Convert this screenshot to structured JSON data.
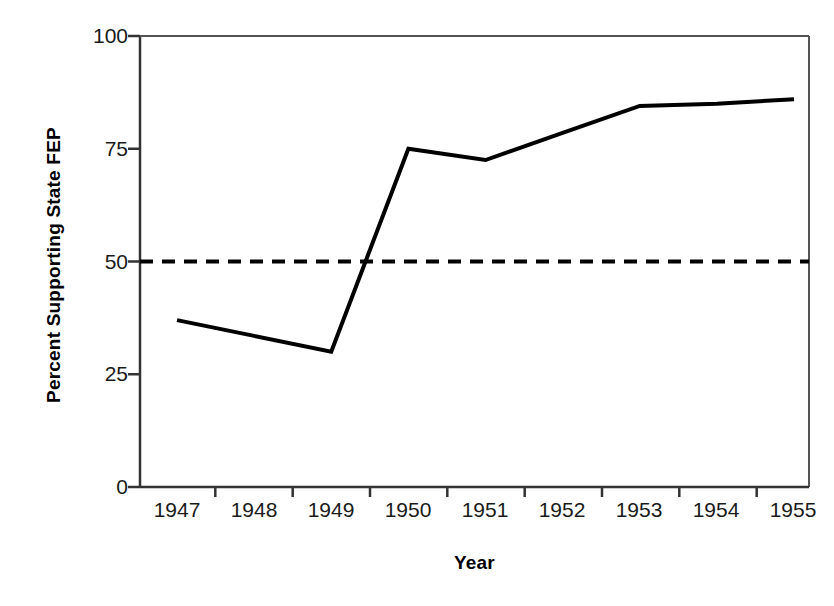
{
  "chart_data": {
    "type": "line",
    "title": "",
    "subtitle": "",
    "xlabel": "Year",
    "ylabel": "Percent Supporting State FEP",
    "categories": [
      "1947",
      "1948",
      "1949",
      "1950",
      "1951",
      "1952",
      "1953",
      "1954",
      "1955"
    ],
    "x": [
      1947,
      1948,
      1949,
      1950,
      1951,
      1952,
      1953,
      1954,
      1955
    ],
    "series": [
      {
        "name": "Percent Supporting State FEP",
        "values": [
          37,
          33.5,
          30,
          75,
          72.5,
          78.5,
          84.5,
          85,
          86
        ],
        "style": "solid",
        "color": "#000000",
        "width": 4
      }
    ],
    "reference_lines": [
      {
        "name": "majority-threshold",
        "orientation": "horizontal",
        "value": 50,
        "style": "dashed",
        "color": "#000000",
        "width": 4
      }
    ],
    "ylim": [
      0,
      100
    ],
    "yticks": [
      0,
      25,
      50,
      75,
      100
    ],
    "ytick_labels": [
      "0",
      "25",
      "50",
      "75",
      "100"
    ],
    "xtick_labels": [
      "1947",
      "1948",
      "1949",
      "1950",
      "1951",
      "1952",
      "1953",
      "1954",
      "1955"
    ],
    "grid": false,
    "legend": false,
    "legend_position": "none",
    "axis_color": "#000000",
    "background": "#ffffff"
  },
  "axes": {
    "y_title": "Percent Supporting State FEP",
    "x_title": "Year"
  }
}
